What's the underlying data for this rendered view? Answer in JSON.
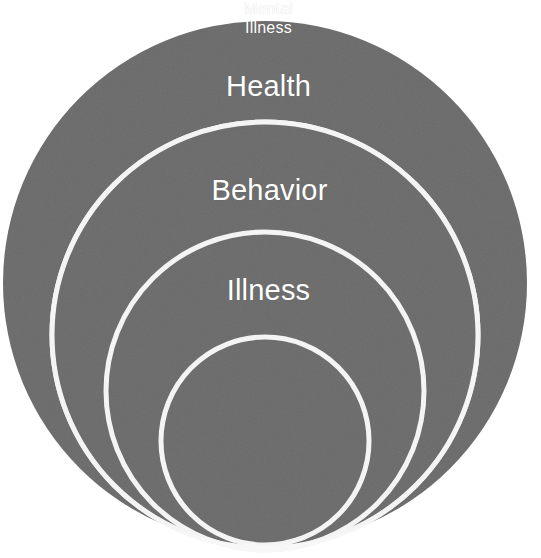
{
  "figure": {
    "type": "concentric-circles-diagram",
    "background_color": "#ffffff",
    "fill_color": "#6b6b6b",
    "ring_stroke_color": "#f7f7f7",
    "label_color": "#ffffff",
    "rings": [
      {
        "id": "health",
        "label": "Health",
        "level": 1,
        "center_x": 265,
        "center_y": 283,
        "radius": 262,
        "label_x": 268,
        "label_y": 85
      },
      {
        "id": "behavior",
        "label": "Behavior",
        "level": 2,
        "center_x": 265,
        "center_y": 335,
        "radius": 213,
        "label_x": 269,
        "label_y": 189
      },
      {
        "id": "illness",
        "label": "Illness",
        "level": 3,
        "center_x": 265,
        "center_y": 391,
        "radius": 159,
        "label_x": 268,
        "label_y": 289
      },
      {
        "id": "mental-illness",
        "label": "Mental\nIllness",
        "level": 4,
        "center_x": 265,
        "center_y": 441,
        "radius": 104,
        "label_x": 268,
        "label_y": 444
      }
    ]
  }
}
